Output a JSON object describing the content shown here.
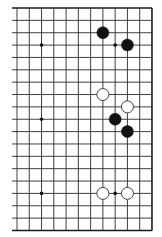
{
  "board": {
    "type": "go-board-fragment",
    "rows": 19,
    "visible_columns": 12,
    "left_edge_cut": true,
    "origin_x": 17,
    "origin_y": 8,
    "spacing_x": 12.27,
    "spacing_y": 12.36,
    "line_color": "#2a2a2a",
    "border_color": "#1a1a1a",
    "background": "#ffffff"
  },
  "hoshi": [
    {
      "col": 2,
      "row": 3
    },
    {
      "col": 8,
      "row": 3
    },
    {
      "col": 2,
      "row": 9
    },
    {
      "col": 2,
      "row": 15
    },
    {
      "col": 8,
      "row": 15
    }
  ],
  "stones": [
    {
      "color": "black",
      "col": 7,
      "row": 2
    },
    {
      "color": "black",
      "col": 9,
      "row": 3
    },
    {
      "color": "white",
      "col": 7,
      "row": 7
    },
    {
      "color": "white",
      "col": 9,
      "row": 8
    },
    {
      "color": "black",
      "col": 8,
      "row": 9
    },
    {
      "color": "black",
      "col": 9,
      "row": 10
    },
    {
      "color": "white",
      "col": 7,
      "row": 15
    },
    {
      "color": "white",
      "col": 9,
      "row": 15
    }
  ],
  "colors": {
    "black_stone": "#111111",
    "white_stone_fill": "#ffffff",
    "white_stone_stroke": "#333333"
  }
}
